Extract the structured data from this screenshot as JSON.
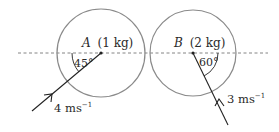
{
  "diagram": {
    "type": "collision-diagram",
    "baseline": {
      "style": "dashed",
      "color": "#777777"
    },
    "spheres": [
      {
        "id": "A",
        "label_letter": "A",
        "label_mass": "(1 kg)",
        "angle_label": "45°",
        "speed_label": "4 ms",
        "speed_exp": "−1",
        "circle_color": "#8a8a8a"
      },
      {
        "id": "B",
        "label_letter": "B",
        "label_mass": "(2 kg)",
        "angle_label": "60°",
        "speed_label": "3 ms",
        "speed_exp": "−1",
        "circle_color": "#8a8a8a"
      }
    ]
  }
}
